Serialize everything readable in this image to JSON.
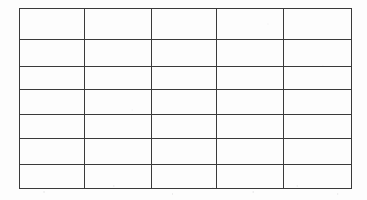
{
  "document": {
    "type": "scanned-form",
    "description": "Blank ruled table grid on white paper",
    "background_color": "#fdfdfd",
    "line_color": "#3a3a3a",
    "line_width_px": 1.5
  },
  "table": {
    "name": "empty-grid-table",
    "rows": 7,
    "columns": 5,
    "has_header": false,
    "all_cells_empty": true,
    "bounds": {
      "x": 19,
      "y": 8,
      "width": 332,
      "height": 180
    },
    "column_edges_px": [
      19,
      84,
      151,
      216,
      283,
      351
    ],
    "column_widths_px": [
      65,
      67,
      65,
      67,
      68
    ],
    "row_edges_px": [
      8,
      39,
      66,
      89,
      114,
      138,
      164,
      188
    ],
    "row_heights_px": [
      31,
      27,
      23,
      25,
      24,
      26,
      24
    ],
    "cells": [
      [
        "",
        "",
        "",
        "",
        ""
      ],
      [
        "",
        "",
        "",
        "",
        ""
      ],
      [
        "",
        "",
        "",
        "",
        ""
      ],
      [
        "",
        "",
        "",
        "",
        ""
      ],
      [
        "",
        "",
        "",
        "",
        ""
      ],
      [
        "",
        "",
        "",
        "",
        ""
      ],
      [
        "",
        "",
        "",
        "",
        ""
      ]
    ]
  }
}
